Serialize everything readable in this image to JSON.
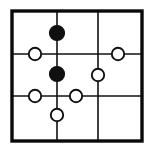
{
  "figure": {
    "background_color": "#ffffff",
    "ink_color": "#111111",
    "frame": {
      "label": "outer-square-border",
      "x": 12,
      "y": 11,
      "width": 130,
      "height": 130,
      "stroke_width": 3.4,
      "color": "#0a0a0a"
    },
    "grid": {
      "rows": 3,
      "columns": 3,
      "vertical_lines": [
        {
          "label": "vertical-line-1",
          "x": 57
        },
        {
          "label": "vertical-line-2",
          "x": 98
        }
      ],
      "horizontal_lines": [
        {
          "label": "horizontal-line-1",
          "y": 54
        },
        {
          "label": "horizontal-line-2",
          "y": 96
        }
      ],
      "line_color": "#111111",
      "stroke_width": 1.6
    },
    "nodes": [
      {
        "label": "filled-node-top-center",
        "type": "filled",
        "cx": 57,
        "cy": 33,
        "r": 7.5,
        "on_line": "vertical-line-1"
      },
      {
        "label": "open-node-left-upper",
        "type": "open",
        "cx": 35,
        "cy": 54,
        "r": 6.2,
        "on_line": "horizontal-line-1"
      },
      {
        "label": "open-node-right-upper",
        "type": "open",
        "cx": 118,
        "cy": 54,
        "r": 6.2,
        "on_line": "horizontal-line-1"
      },
      {
        "label": "filled-node-center",
        "type": "filled",
        "cx": 57,
        "cy": 74,
        "r": 7.5,
        "on_line": "vertical-line-1"
      },
      {
        "label": "open-node-right-middle",
        "type": "open",
        "cx": 98,
        "cy": 75,
        "r": 6.2,
        "on_line": "vertical-line-2"
      },
      {
        "label": "open-node-left-lower",
        "type": "open",
        "cx": 35,
        "cy": 96,
        "r": 6.2,
        "on_line": "horizontal-line-2"
      },
      {
        "label": "open-node-center-lower",
        "type": "open",
        "cx": 76,
        "cy": 96,
        "r": 6.2,
        "on_line": "horizontal-line-2"
      },
      {
        "label": "open-node-bottom-center",
        "type": "open",
        "cx": 57,
        "cy": 115,
        "r": 6.2,
        "on_line": "vertical-line-1"
      }
    ],
    "counts": {
      "filled_nodes": 2,
      "open_nodes": 6,
      "total_nodes": 8
    }
  }
}
